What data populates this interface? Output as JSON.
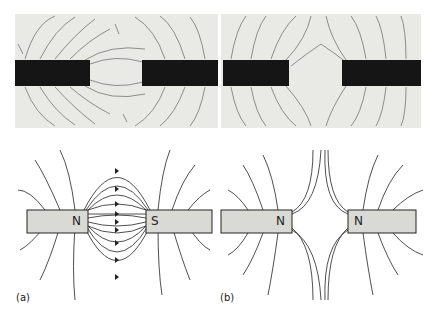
{
  "photos": {
    "left": {
      "description": "iron filings around unlike poles (N-S)"
    },
    "right": {
      "description": "iron filings around like poles (N-N)"
    }
  },
  "diagrams": {
    "a": {
      "panel_label": "(a)",
      "left_pole": "N",
      "right_pole": "S"
    },
    "b": {
      "panel_label": "(b)",
      "left_pole": "N",
      "right_pole": "N"
    }
  },
  "colors": {
    "magnet_photo": "#151515",
    "magnet_fill": "#d9d9d6",
    "line": "#222222",
    "photo_bg": "#e9e9e6"
  }
}
